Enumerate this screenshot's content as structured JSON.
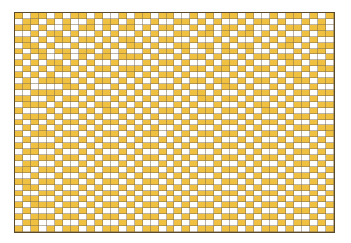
{
  "board": {
    "columns": 40,
    "rows": 37,
    "colors": {
      "filled": "#f0c040",
      "empty": "#ffffff",
      "grid_line": "#7a6a50",
      "border": "#5a4a2a"
    },
    "cells": [
      "1011010110100101101100101011010010110101",
      "0110101001011010010011010100101101001010",
      "1101001011010110101100101011010010110110",
      "0010110100101001010011011010110101001011",
      "1101011011010110101100100101001010110100",
      "0110100100101011010011011010110101101011",
      "1011011011010100101101001011010010010110",
      "0101001010110111010010110100101101101001",
      "1010110101001000101101001011010010110110",
      "0101011010110111010010110110101101001011",
      "1010100101001010101101001001010010110100",
      "0101111010110101010010110110101101011011",
      "1100001101001010101101001011010010100100",
      "0011110010110101010010110100101101011011",
      "1100101101001010101101011011010010100100",
      "0111010010110101010010100100101101011011",
      "1000101101011010101101011011010110100100",
      "0111010010100101010010100100101001011011",
      "1010101101011010101101011011010110100100",
      "0101010010100101010010100100101001011011",
      "1011101101011010110101011011010110100101",
      "0100010010100101001010100100101001011010",
      "1011101101011010110101011011010110100101",
      "0110010010100101001010100100101001011010",
      "1001101101011010110101011011010110100101",
      "0110010010100101001010100100101001011010",
      "1101101101011010110101011011010110100101",
      "0010010010100101001010100100101001011010",
      "1101101101011010110101011011010110100101",
      "0110010010100101001010100100101001011010",
      "1001101101011010110101011011010110100101",
      "0110010010100101001010100100101001011010",
      "1011101101011010110101011011010110100101",
      "0100010010100101001010100100101001011010",
      "1011101101011010110101011011010110100101",
      "0110010010100101001010100100101001011010",
      "1010101101011010110101011011010110100101"
    ]
  }
}
